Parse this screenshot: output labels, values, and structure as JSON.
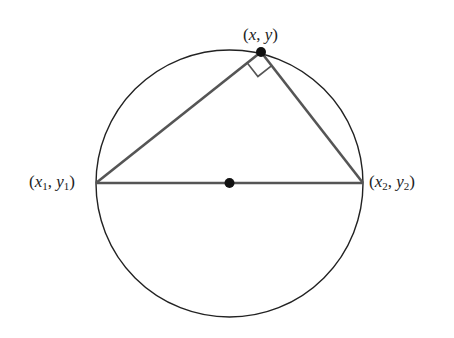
{
  "diagram": {
    "labels": {
      "top_point": {
        "x": "x",
        "sep": ", ",
        "y": "y"
      },
      "left_point": {
        "x": "x",
        "xsub": "1",
        "sep": ", ",
        "y": "y",
        "ysub": "1"
      },
      "right_point": {
        "x": "x",
        "xsub": "2",
        "sep": ", ",
        "y": "y",
        "ysub": "2"
      }
    },
    "colors": {
      "circle": "#222222",
      "triangle": "#555555",
      "points": "#111111"
    }
  }
}
